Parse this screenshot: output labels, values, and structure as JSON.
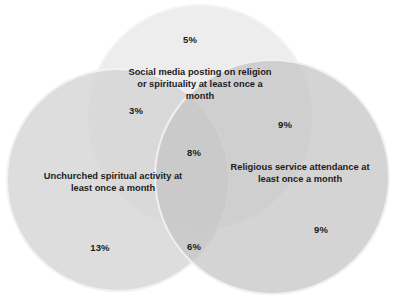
{
  "chart_data": {
    "type": "venn",
    "title": "",
    "subtitle": "",
    "xlabel": "",
    "ylabel": "",
    "grid": false,
    "legend_position": "inline-labels",
    "units": "percent",
    "sets": [
      {
        "id": "unchurched",
        "label": "Unchurched spiritual activity at\nleast once a month",
        "color": "#d2d2d2",
        "label_x": 113,
        "label_y": 182
      },
      {
        "id": "social_media",
        "label": "Social media posting on religion\nor spirituality at least once a\nmonth",
        "color": "#eaeaea",
        "label_x": 200,
        "label_y": 84
      },
      {
        "id": "religious_service",
        "label": "Religious service attendance at\nleast once a month",
        "color": "#bfbfbf",
        "label_x": 300,
        "label_y": 173
      }
    ],
    "regions": [
      {
        "id": "social-media-only",
        "sets": [
          "social_media"
        ],
        "value": "5%",
        "x": 190,
        "y": 39
      },
      {
        "id": "unchurched-and-social-media",
        "sets": [
          "unchurched",
          "social_media"
        ],
        "value": "3%",
        "x": 136,
        "y": 110
      },
      {
        "id": "religious-service-and-social-media",
        "sets": [
          "religious_service",
          "social_media"
        ],
        "value": "9%",
        "x": 285,
        "y": 124
      },
      {
        "id": "all-three",
        "sets": [
          "unchurched",
          "social_media",
          "religious_service"
        ],
        "value": "8%",
        "x": 194,
        "y": 152
      },
      {
        "id": "unchurched-only",
        "sets": [
          "unchurched"
        ],
        "value": "13%",
        "x": 100,
        "y": 247
      },
      {
        "id": "unchurched-and-religious-service",
        "sets": [
          "unchurched",
          "religious_service"
        ],
        "value": "6%",
        "x": 194,
        "y": 246
      },
      {
        "id": "religious-service-only",
        "sets": [
          "religious_service"
        ],
        "value": "9%",
        "x": 321,
        "y": 229
      }
    ],
    "categories": [
      "5%",
      "3%",
      "9%",
      "8%",
      "13%",
      "6%",
      "9%"
    ],
    "values": [
      5,
      3,
      9,
      8,
      13,
      6,
      9
    ],
    "colors": {
      "background": "#ffffff",
      "circle_unchurched": "#d2d2d2",
      "circle_social_media": "#eaeaea",
      "circle_religious_service": "#bfbfbf",
      "text": "#1c1c1c"
    },
    "geometry": {
      "circles": [
        {
          "id": "unchurched",
          "cx": 118,
          "cy": 180,
          "r": 111
        },
        {
          "id": "social_media",
          "cx": 200,
          "cy": 117,
          "r": 112
        },
        {
          "id": "religious_service",
          "cx": 272,
          "cy": 177,
          "r": 117
        }
      ]
    }
  }
}
